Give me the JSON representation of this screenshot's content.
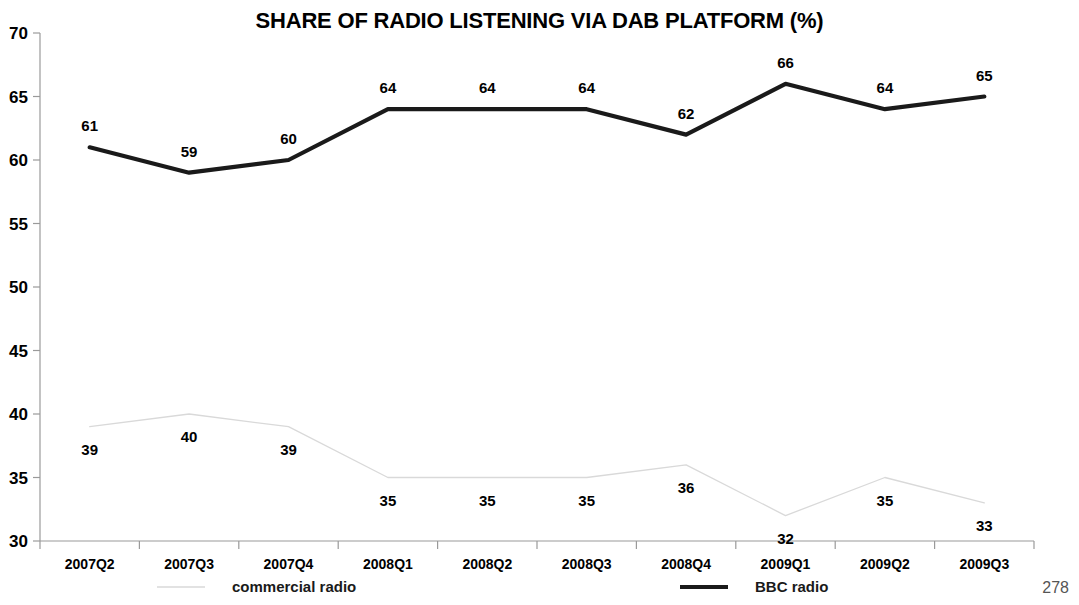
{
  "page": {
    "page_number": "278"
  },
  "chart_data": {
    "type": "line",
    "title": "SHARE OF RADIO LISTENING VIA DAB PLATFORM (%)",
    "xlabel": "",
    "ylabel": "",
    "ylim": [
      30,
      70
    ],
    "yticks": [
      30,
      35,
      40,
      45,
      50,
      55,
      60,
      65,
      70
    ],
    "ytick_labels": [
      "30",
      "35",
      "40",
      "45",
      "50",
      "55",
      "60",
      "65",
      "70"
    ],
    "grid": false,
    "legend_position": "bottom",
    "categories": [
      "2007Q2",
      "2007Q3",
      "2007Q4",
      "2008Q1",
      "2008Q2",
      "2008Q3",
      "2008Q4",
      "2009Q1",
      "2009Q2",
      "2009Q3"
    ],
    "series": [
      {
        "name": "commercial radio",
        "color": "#d9d9d9",
        "style": "light-thin",
        "values": [
          39,
          40,
          39,
          35,
          35,
          35,
          36,
          32,
          35,
          33
        ],
        "labels": [
          "39",
          "40",
          "39",
          "35",
          "35",
          "35",
          "36",
          "32",
          "35",
          "33"
        ],
        "label_positions": [
          "below",
          "below",
          "below",
          "below",
          "below",
          "below",
          "below",
          "below",
          "below",
          "below"
        ]
      },
      {
        "name": "BBC radio",
        "color": "#1a1a1a",
        "style": "thick-solid",
        "values": [
          61,
          59,
          60,
          64,
          64,
          64,
          62,
          66,
          64,
          65
        ],
        "labels": [
          "61",
          "59",
          "60",
          "64",
          "64",
          "64",
          "62",
          "66",
          "64",
          "65"
        ],
        "label_positions": [
          "above",
          "above",
          "above",
          "above",
          "above",
          "above",
          "above",
          "above",
          "above",
          "above"
        ]
      }
    ],
    "legend": [
      {
        "label": "commercial radio",
        "color": "#d9d9d9",
        "style": "light-thin"
      },
      {
        "label": "BBC radio",
        "color": "#1a1a1a",
        "style": "thick-solid"
      }
    ]
  }
}
